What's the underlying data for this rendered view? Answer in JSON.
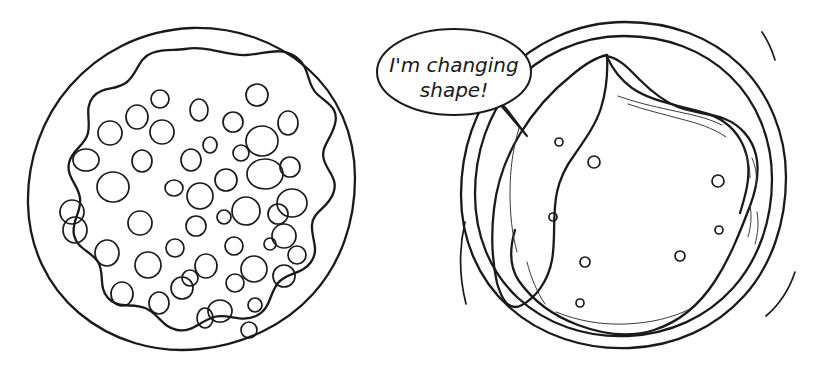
{
  "illustration": {
    "title": "Cell changing shape",
    "background_color": "#ffffff",
    "ink_color": "#1a1a1a",
    "wisp_color": "#3a3a3a"
  },
  "speech_bubble": {
    "name": "speech-bubble",
    "line1": "I'm changing",
    "line2": "shape!",
    "full_text": "I'm changing shape!",
    "ellipse": {
      "cx": 454,
      "cy": 72,
      "rx": 77,
      "ry": 43
    },
    "text_line1_pos": {
      "x": 454,
      "y": 72
    },
    "text_line2_pos": {
      "x": 454,
      "y": 97
    },
    "tail_path": "M 498 102 L 527 136 L 505 107 Z"
  },
  "left_cell": {
    "name": "round-cell",
    "label": "round cell with many vacuoles",
    "outer_membrane_path": "M 192 28 C 236 27 276 41 307 68 C 338 95 355 134 355 178 C 355 222 341 263 313 294 C 285 325 245 344 200 349 C 155 354 111 340 79 313 C 47 286 29 247 28 204 C 27 161 42 118 70 86 C 98 54 140 30 192 28 Z",
    "inner_blob_path": "M 185 49 C 207 45 226 56 246 55 C 266 54 281 46 296 57 C 311 68 306 84 317 94 C 328 104 339 108 335 124 C 331 140 320 147 324 160 C 328 173 339 179 333 194 C 327 209 313 211 312 225 C 311 239 320 249 311 262 C 302 275 287 272 278 283 C 269 294 271 309 256 316 C 241 323 228 313 214 317 C 200 321 192 333 177 330 C 162 327 158 313 145 308 C 132 303 118 309 108 298 C 98 287 105 273 98 262 C 91 251 77 249 74 235 C 71 221 82 212 80 198 C 78 184 66 177 69 163 C 72 149 85 146 88 133 C 91 120 84 108 93 97 C 102 86 116 91 127 82 C 138 73 138 58 152 53 C 166 48 174 51 185 49 Z",
    "vacuoles": [
      {
        "cx": 86,
        "cy": 160,
        "rx": 13,
        "ry": 11
      },
      {
        "cx": 72,
        "cy": 212,
        "rx": 12,
        "ry": 12
      },
      {
        "cx": 75,
        "cy": 230,
        "rx": 12,
        "ry": 13
      },
      {
        "cx": 110,
        "cy": 133,
        "rx": 12,
        "ry": 12
      },
      {
        "cx": 113,
        "cy": 187,
        "rx": 16,
        "ry": 15
      },
      {
        "cx": 107,
        "cy": 253,
        "rx": 12,
        "ry": 13
      },
      {
        "cx": 122,
        "cy": 294,
        "rx": 11,
        "ry": 12
      },
      {
        "cx": 137,
        "cy": 117,
        "rx": 11,
        "ry": 12
      },
      {
        "cx": 142,
        "cy": 161,
        "rx": 10,
        "ry": 11
      },
      {
        "cx": 140,
        "cy": 223,
        "rx": 12,
        "ry": 12
      },
      {
        "cx": 148,
        "cy": 265,
        "rx": 13,
        "ry": 13
      },
      {
        "cx": 160,
        "cy": 99,
        "rx": 9,
        "ry": 9
      },
      {
        "cx": 162,
        "cy": 132,
        "rx": 12,
        "ry": 12
      },
      {
        "cx": 159,
        "cy": 303,
        "rx": 10,
        "ry": 11
      },
      {
        "cx": 174,
        "cy": 188,
        "rx": 9,
        "ry": 8
      },
      {
        "cx": 175,
        "cy": 248,
        "rx": 9,
        "ry": 9
      },
      {
        "cx": 182,
        "cy": 288,
        "rx": 11,
        "ry": 11
      },
      {
        "cx": 190,
        "cy": 278,
        "rx": 8,
        "ry": 8
      },
      {
        "cx": 191,
        "cy": 160,
        "rx": 10,
        "ry": 11
      },
      {
        "cx": 196,
        "cy": 226,
        "rx": 10,
        "ry": 10
      },
      {
        "cx": 199,
        "cy": 110,
        "rx": 9,
        "ry": 11
      },
      {
        "cx": 200,
        "cy": 196,
        "rx": 13,
        "ry": 13
      },
      {
        "cx": 205,
        "cy": 318,
        "rx": 8,
        "ry": 10
      },
      {
        "cx": 206,
        "cy": 266,
        "rx": 11,
        "ry": 12
      },
      {
        "cx": 210,
        "cy": 145,
        "rx": 7,
        "ry": 8
      },
      {
        "cx": 220,
        "cy": 311,
        "rx": 12,
        "ry": 11
      },
      {
        "cx": 224,
        "cy": 217,
        "rx": 7,
        "ry": 7
      },
      {
        "cx": 226,
        "cy": 180,
        "rx": 11,
        "ry": 11
      },
      {
        "cx": 233,
        "cy": 122,
        "rx": 10,
        "ry": 10
      },
      {
        "cx": 234,
        "cy": 246,
        "rx": 9,
        "ry": 9
      },
      {
        "cx": 235,
        "cy": 283,
        "rx": 9,
        "ry": 9
      },
      {
        "cx": 241,
        "cy": 153,
        "rx": 8,
        "ry": 8
      },
      {
        "cx": 246,
        "cy": 211,
        "rx": 14,
        "ry": 14
      },
      {
        "cx": 249,
        "cy": 330,
        "rx": 8,
        "ry": 8
      },
      {
        "cx": 254,
        "cy": 269,
        "rx": 13,
        "ry": 13
      },
      {
        "cx": 255,
        "cy": 305,
        "rx": 7,
        "ry": 7
      },
      {
        "cx": 257,
        "cy": 95,
        "rx": 11,
        "ry": 11
      },
      {
        "cx": 262,
        "cy": 141,
        "rx": 16,
        "ry": 15
      },
      {
        "cx": 265,
        "cy": 174,
        "rx": 18,
        "ry": 15
      },
      {
        "cx": 270,
        "cy": 244,
        "rx": 6,
        "ry": 6
      },
      {
        "cx": 278,
        "cy": 214,
        "rx": 10,
        "ry": 10
      },
      {
        "cx": 284,
        "cy": 236,
        "rx": 12,
        "ry": 12
      },
      {
        "cx": 284,
        "cy": 276,
        "rx": 11,
        "ry": 11
      },
      {
        "cx": 288,
        "cy": 123,
        "rx": 10,
        "ry": 12
      },
      {
        "cx": 290,
        "cy": 167,
        "rx": 10,
        "ry": 10
      },
      {
        "cx": 292,
        "cy": 203,
        "rx": 15,
        "ry": 14
      },
      {
        "cx": 297,
        "cy": 255,
        "rx": 9,
        "ry": 9
      }
    ]
  },
  "right_cell": {
    "name": "shape-changing-cell",
    "label": "cell changing shape with pseudopod notch",
    "outer_membrane_outer_path": "M 625 22 C 671 22 711 37 740 65 C 769 93 786 134 786 177 C 786 222 772 265 744 296 C 716 327 676 346 630 348 C 584 350 540 335 509 307 C 478 279 461 239 461 195 C 461 150 475 108 503 76 C 531 44 576 22 625 22 Z",
    "outer_membrane_inner_path": "M 624 36 C 666 36 703 50 730 76 C 757 102 772 139 772 179 C 772 220 759 259 733 288 C 707 317 670 334 628 336 C 586 338 546 324 518 298 C 490 272 475 235 475 194 C 475 153 488 114 513 85 C 538 56 579 36 624 36 Z",
    "cytoplasm_path": "M 607 55 C 608 73 606 92 601 108 C 596 124 586 138 575 154 C 566 166 560 178 557 192 C 552 215 556 238 552 260 C 548 282 535 298 522 305 C 509 312 502 300 497 283 C 492 260 491 234 494 209 C 497 183 506 157 520 134 C 534 111 553 90 572 75 C 585 64 597 57 607 55 Z",
    "inner_boundary_path": "M 606 56 C 620 58 630 70 640 80 C 652 92 663 101 678 107 C 693 113 710 113 725 119 C 740 125 752 138 756 155 C 760 172 756 190 750 206 C 740 232 730 258 715 281 C 700 304 679 322 654 330 C 629 338 602 334 578 325 C 554 316 533 301 519 281 C 508 265 510 247 515 230",
    "notch_wave_path": "M 607 57 C 613 70 621 80 632 88 C 645 97 660 101 675 105 C 692 110 710 112 724 122 C 737 131 746 146 748 163 C 750 180 745 197 740 213",
    "granules": [
      {
        "cx": 559,
        "cy": 142,
        "r": 4
      },
      {
        "cx": 594,
        "cy": 162,
        "r": 6
      },
      {
        "cx": 718,
        "cy": 181,
        "r": 6
      },
      {
        "cx": 553,
        "cy": 217,
        "r": 4
      },
      {
        "cx": 719,
        "cy": 230,
        "r": 4
      },
      {
        "cx": 680,
        "cy": 256,
        "r": 5
      },
      {
        "cx": 585,
        "cy": 262,
        "r": 5
      },
      {
        "cx": 580,
        "cy": 303,
        "r": 4
      }
    ],
    "motion_lines": [
      {
        "name": "motion-arc-top-right",
        "path": "M 762 32 C 768 41 772 50 775 60"
      },
      {
        "name": "motion-arc-left",
        "path": "M 465 222 C 459 248 459 276 466 304"
      },
      {
        "name": "motion-arc-bottom-right",
        "path": "M 795 272 C 789 290 779 305 766 316"
      }
    ],
    "wisps": [
      {
        "path": "M 618 96 C 634 102 652 106 670 110 C 688 114 706 117 722 125"
      },
      {
        "path": "M 628 104 C 645 110 663 114 681 119 C 697 123 713 128 726 137"
      },
      {
        "path": "M 744 150 C 748 159 750 168 750 178"
      },
      {
        "path": "M 752 158 C 756 167 757 176 756 186"
      },
      {
        "path": "M 750 205 C 752 216 751 227 748 237"
      },
      {
        "path": "M 757 212 C 759 223 758 234 755 244"
      },
      {
        "path": "M 519 128 C 513 148 510 170 510 192 C 510 214 512 234 517 252"
      },
      {
        "path": "M 527 262 C 531 278 537 292 545 304"
      },
      {
        "path": "M 556 312 C 578 321 602 325 626 324 C 650 323 672 318 690 309"
      }
    ]
  }
}
